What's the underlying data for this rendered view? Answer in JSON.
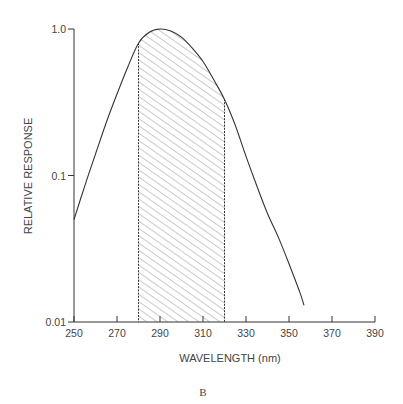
{
  "chart_data": {
    "type": "line",
    "title": "",
    "panel_label": "B",
    "xlabel": "WAVELENGTH (nm)",
    "ylabel": "RELATIVE RESPONSE",
    "xlim": [
      250,
      390
    ],
    "ylim": [
      0.01,
      1.0
    ],
    "yscale": "log",
    "grid": false,
    "legend": null,
    "x_ticks": [
      250,
      270,
      290,
      310,
      330,
      350,
      370,
      390
    ],
    "x_tick_labels": [
      "250",
      "270",
      "290",
      "310",
      "330",
      "350",
      "370",
      "390"
    ],
    "y_ticks": [
      0.01,
      0.1,
      1.0
    ],
    "y_tick_labels": [
      "0.01",
      "0.1",
      "1.0"
    ],
    "series": [
      {
        "name": "Relative response",
        "x": [
          250,
          255,
          260,
          265,
          270,
          275,
          280,
          285,
          290,
          295,
          300,
          305,
          310,
          315,
          320,
          325,
          330,
          335,
          340,
          345,
          350,
          355,
          357
        ],
        "y": [
          0.05,
          0.085,
          0.14,
          0.23,
          0.36,
          0.55,
          0.8,
          0.95,
          1.0,
          0.97,
          0.88,
          0.74,
          0.6,
          0.45,
          0.33,
          0.22,
          0.135,
          0.085,
          0.055,
          0.038,
          0.025,
          0.016,
          0.013
        ]
      }
    ],
    "shaded_region": {
      "x_start": 280,
      "x_end": 320,
      "pattern": "diagonal-hatch",
      "label": ""
    },
    "colors": {
      "line": "#333333",
      "hatch": "#8a8a8a",
      "axis": "#333333"
    }
  },
  "axis": {
    "x_title": "WAVELENGTH (nm)",
    "y_title": "RELATIVE RESPONSE",
    "x_labels": [
      "250",
      "270",
      "290",
      "310",
      "330",
      "350",
      "370",
      "390"
    ],
    "y_labels": [
      "0.01",
      "0.1",
      "1.0"
    ]
  },
  "panel_label": "B"
}
